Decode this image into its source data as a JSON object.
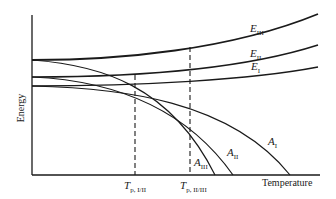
{
  "diagram": {
    "title": "",
    "y_axis_label": "Energy",
    "x_axis_label": "Temperature",
    "curves": [
      {
        "id": "E_III",
        "base": "E",
        "sub": "III",
        "kind": "energy"
      },
      {
        "id": "E_II",
        "base": "E",
        "sub": "II",
        "kind": "energy"
      },
      {
        "id": "E_I",
        "base": "E",
        "sub": "I",
        "kind": "energy"
      },
      {
        "id": "A_I",
        "base": "A",
        "sub": "I",
        "kind": "free-energy"
      },
      {
        "id": "A_II",
        "base": "A",
        "sub": "II",
        "kind": "free-energy"
      },
      {
        "id": "A_III",
        "base": "A",
        "sub": "III",
        "kind": "free-energy"
      }
    ],
    "transitions": [
      {
        "base": "T",
        "sub": "p, I/II"
      },
      {
        "base": "T",
        "sub": "p, II/III"
      }
    ],
    "colors": {
      "line": "#1a1a1a",
      "background": "#ffffff"
    }
  }
}
